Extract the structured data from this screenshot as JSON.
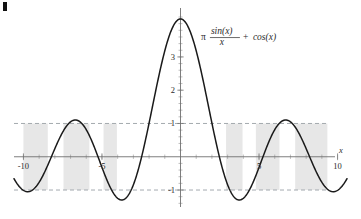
{
  "chart_data": {
    "type": "line",
    "title": "",
    "subtitle": "",
    "xlabel": "x",
    "ylabel": "",
    "xlim": [
      -10.6,
      10.6
    ],
    "ylim": [
      -1.45,
      4.35
    ],
    "grid": false,
    "legend_position": "inside-top-right",
    "function_expression": "pi*sin(x)/x + cos(x)",
    "annotations": [
      {
        "name": "function-label",
        "text": "π sin(x)/x + cos(x)",
        "pi_symbol": "π",
        "numerator": "sin(x)",
        "denominator": "x",
        "plus": "+",
        "trailing": "cos(x)",
        "x": 1.3,
        "y": 3.6
      }
    ],
    "x_ticks_major": [
      -10,
      -5,
      5,
      10
    ],
    "x_tick_labels": [
      "-10",
      "-5",
      "5",
      "10"
    ],
    "x_ticks_minor_step": 1,
    "y_ticks_major": [
      -1,
      1,
      2,
      3
    ],
    "y_tick_labels": [
      "-1",
      "1",
      "2",
      "3"
    ],
    "y_ticks_minor_step": 0.2,
    "reference_lines": [
      {
        "name": "upper-dashed-line",
        "y": 1,
        "style": "dashed",
        "color": "#9aa0a6"
      },
      {
        "name": "lower-dashed-line",
        "y": -1,
        "style": "dashed",
        "color": "#9aa0a6"
      }
    ],
    "shaded_bands": [
      {
        "x0": -10.0,
        "x1": -8.45
      },
      {
        "x0": -7.45,
        "x1": -5.8
      },
      {
        "x0": -4.9,
        "x1": -4.05
      },
      {
        "x0": 2.9,
        "x1": 3.95
      },
      {
        "x0": 4.8,
        "x1": 6.3
      },
      {
        "x0": 7.3,
        "x1": 9.35
      }
    ],
    "band_y_range": [
      -1,
      1
    ],
    "band_color": "#d9d9d9",
    "curve_color": "#1a1a1a",
    "axis_color": "#6f6f6f",
    "peak_value": 4.14,
    "peak_x": 0,
    "series": [
      {
        "name": "pi*sin(x)/x + cos(x)",
        "x": [
          -10.5,
          -10.2,
          -9.9,
          -9.6,
          -9.3,
          -9.0,
          -8.7,
          -8.4,
          -8.1,
          -7.8,
          -7.5,
          -7.2,
          -6.9,
          -6.6,
          -6.3,
          -6.0,
          -5.7,
          -5.4,
          -5.1,
          -4.8,
          -4.5,
          -4.2,
          -3.9,
          -3.6,
          -3.3,
          -3.0,
          -2.7,
          -2.4,
          -2.1,
          -1.8,
          -1.5,
          -1.2,
          -0.9,
          -0.6,
          -0.3,
          0.0,
          0.3,
          0.6,
          0.9,
          1.2,
          1.5,
          1.8,
          2.1,
          2.4,
          2.7,
          3.0,
          3.3,
          3.6,
          3.9,
          4.2,
          4.5,
          4.8,
          5.1,
          5.4,
          5.7,
          6.0,
          6.3,
          6.6,
          6.9,
          7.2,
          7.5,
          7.8,
          8.1,
          8.4,
          8.7,
          9.0,
          9.3,
          9.6,
          9.9,
          10.2,
          10.5
        ],
        "y": [
          -0.7,
          -0.87,
          -0.97,
          -0.99,
          -0.92,
          -0.8,
          -0.63,
          -0.45,
          -0.31,
          -0.23,
          -0.25,
          -0.37,
          -0.57,
          -0.79,
          -0.96,
          -1.05,
          -1.02,
          -0.88,
          -0.64,
          -0.35,
          -0.06,
          0.2,
          0.4,
          0.53,
          0.58,
          0.57,
          0.53,
          0.5,
          0.54,
          0.7,
          1.03,
          1.56,
          2.26,
          3.04,
          3.74,
          4.14,
          3.74,
          3.04,
          2.26,
          1.56,
          1.03,
          0.7,
          0.54,
          0.5,
          0.53,
          0.57,
          0.58,
          0.53,
          0.4,
          0.2,
          -0.06,
          -0.35,
          -0.64,
          -0.88,
          -1.02,
          -1.05,
          -0.96,
          -0.79,
          -0.57,
          -0.37,
          -0.25,
          -0.23,
          -0.31,
          -0.45,
          -0.63,
          -0.8,
          -0.92,
          -0.99,
          -0.97,
          -0.87,
          -0.7
        ]
      }
    ]
  },
  "figure": {
    "corner_mark": "page-edge-mark"
  }
}
